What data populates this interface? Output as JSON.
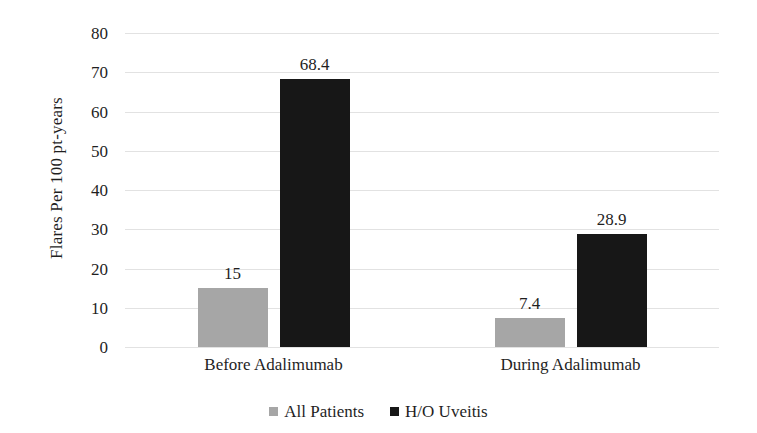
{
  "chart_data": {
    "type": "bar",
    "title": "",
    "subtitle": "",
    "xlabel": "",
    "ylabel": "Flares Per 100 pt-years",
    "categories": [
      "Before Adalimumab",
      "During Adalimumab"
    ],
    "series": [
      {
        "name": "All Patients",
        "color": "#a6a6a6",
        "values": [
          15,
          7.4
        ],
        "labels": [
          "15",
          "7.4"
        ]
      },
      {
        "name": "H/O Uveitis",
        "color": "#171717",
        "values": [
          68.4,
          28.9
        ],
        "labels": [
          "68.4",
          "28.9"
        ]
      }
    ],
    "ylim": [
      0,
      80
    ],
    "y_ticks": [
      80,
      70,
      60,
      50,
      40,
      30,
      20,
      10,
      0
    ],
    "y_tick_labels": [
      "80",
      "70",
      "60",
      "50",
      "40",
      "30",
      "20",
      "10",
      "0"
    ],
    "grid": true,
    "grid_axis": "y",
    "grid_color": "#dddddd",
    "legend": true,
    "legend_position": "bottom",
    "legend_entries": [
      "All Patients",
      "H/O Uveitis"
    ],
    "bar_labels_shown": true,
    "background_color": "#ffffff",
    "text_color": "#1f1f1f"
  },
  "axis": {
    "y_title": "Flares Per 100 pt-years",
    "ticks": [
      "80",
      "70",
      "60",
      "50",
      "40",
      "30",
      "20",
      "10",
      "0"
    ]
  },
  "categories": [
    {
      "label": "Before Adalimumab"
    },
    {
      "label": "During Adalimumab"
    }
  ],
  "bars": [
    {
      "label": "15",
      "series": "All Patients",
      "category": "Before Adalimumab"
    },
    {
      "label": "68.4",
      "series": "H/O Uveitis",
      "category": "Before Adalimumab"
    },
    {
      "label": "7.4",
      "series": "All Patients",
      "category": "During Adalimumab"
    },
    {
      "label": "28.9",
      "series": "H/O Uveitis",
      "category": "During Adalimumab"
    }
  ],
  "legend": {
    "items": [
      {
        "label": "All Patients",
        "color": "#a6a6a6"
      },
      {
        "label": "H/O Uveitis",
        "color": "#171717"
      }
    ]
  }
}
